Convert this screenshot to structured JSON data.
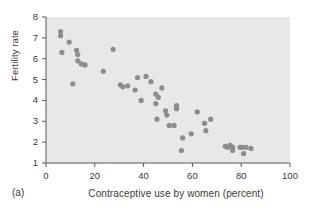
{
  "figure": {
    "panel_label": "(a)",
    "xlabel": "Contraceptive use by women (percent)",
    "ylabel": "Fertility rate"
  },
  "axes": {
    "x_ticks": [
      "0",
      "20",
      "40",
      "60",
      "80",
      "100"
    ],
    "y_ticks": [
      "1",
      "2",
      "3",
      "4",
      "5",
      "6",
      "7",
      "8"
    ]
  },
  "style": {
    "plot_background": "#e8e8e8",
    "point_color": "#8c8c8c",
    "axis_color": "#5a5a5a",
    "text_color": "#3a3a3a"
  },
  "chart_data": {
    "type": "scatter",
    "title": "",
    "xlabel": "Contraceptive use by women (percent)",
    "ylabel": "Fertility rate",
    "xlim": [
      0,
      100
    ],
    "ylim": [
      1,
      8
    ],
    "xticks": [
      0,
      20,
      40,
      60,
      80,
      100
    ],
    "yticks": [
      1,
      2,
      3,
      4,
      5,
      6,
      7,
      8
    ],
    "grid": false,
    "legend": null,
    "marker": "circle",
    "points": [
      [
        6.0,
        7.3
      ],
      [
        6.0,
        7.1
      ],
      [
        6.5,
        6.3
      ],
      [
        9.5,
        6.8
      ],
      [
        11.0,
        4.8
      ],
      [
        12.5,
        6.4
      ],
      [
        13.0,
        6.2
      ],
      [
        13.0,
        5.9
      ],
      [
        14.5,
        5.75
      ],
      [
        16.0,
        5.7
      ],
      [
        23.5,
        5.4
      ],
      [
        27.5,
        6.45
      ],
      [
        30.5,
        4.75
      ],
      [
        31.5,
        4.65
      ],
      [
        33.5,
        4.7
      ],
      [
        36.5,
        4.5
      ],
      [
        37.5,
        5.1
      ],
      [
        39.0,
        4.0
      ],
      [
        41.0,
        5.15
      ],
      [
        43.0,
        4.9
      ],
      [
        45.0,
        4.3
      ],
      [
        45.0,
        3.85
      ],
      [
        45.5,
        3.1
      ],
      [
        46.0,
        4.15
      ],
      [
        47.5,
        4.6
      ],
      [
        49.0,
        3.5
      ],
      [
        49.5,
        3.3
      ],
      [
        50.5,
        2.8
      ],
      [
        52.5,
        2.8
      ],
      [
        53.5,
        3.75
      ],
      [
        53.5,
        3.6
      ],
      [
        55.5,
        1.6
      ],
      [
        56.0,
        2.2
      ],
      [
        59.5,
        2.4
      ],
      [
        62.0,
        3.45
      ],
      [
        65.0,
        2.9
      ],
      [
        65.5,
        2.55
      ],
      [
        67.5,
        3.1
      ],
      [
        73.5,
        1.8
      ],
      [
        74.5,
        1.75
      ],
      [
        75.5,
        1.85
      ],
      [
        76.5,
        1.75
      ],
      [
        76.5,
        1.6
      ],
      [
        79.5,
        1.75
      ],
      [
        80.5,
        1.75
      ],
      [
        81.0,
        1.45
      ],
      [
        82.0,
        1.75
      ],
      [
        84.0,
        1.7
      ]
    ]
  }
}
